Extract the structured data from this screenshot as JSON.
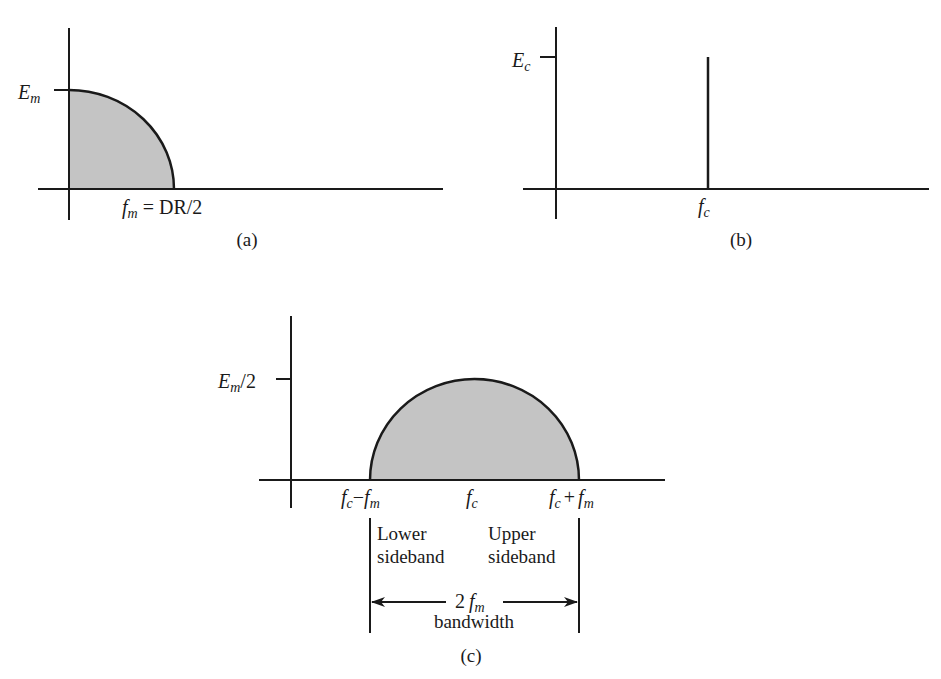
{
  "colors": {
    "ink": "#1a1a1a",
    "fill": "#c4c4c4"
  },
  "panel_a": {
    "caption": "(a)",
    "y_tick_label_main": "E",
    "y_tick_label_sub": "m",
    "x_label_f": "f",
    "x_label_sub": "m",
    "x_label_rest": " = DR/2"
  },
  "panel_b": {
    "caption": "(b)",
    "y_tick_label_main": "E",
    "y_tick_label_sub": "c",
    "x_label_main": "f",
    "x_label_sub": "c"
  },
  "panel_c": {
    "caption": "(c)",
    "y_tick_label_main": "E",
    "y_tick_label_sub": "m",
    "y_tick_label_rest": "/2",
    "x_left": {
      "f": "f",
      "c": "c",
      "minus": "−",
      "f2": "f",
      "m": "m"
    },
    "x_center": {
      "f": "f",
      "c": "c"
    },
    "x_right": {
      "f": "f",
      "c": "c",
      "plus": "+",
      "f2": "f",
      "m": "m"
    },
    "lower_sideband_line1": "Lower",
    "lower_sideband_line2": "sideband",
    "upper_sideband_line1": "Upper",
    "upper_sideband_line2": "sideband",
    "bandwidth_value_num": "2",
    "bandwidth_value_f": "f",
    "bandwidth_value_sub": "m",
    "bandwidth_label": "bandwidth"
  }
}
